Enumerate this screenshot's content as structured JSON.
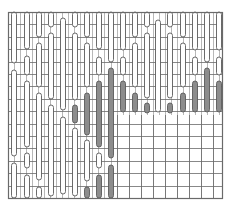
{
  "diagram": {
    "type": "grid-pattern-chart",
    "width": 229,
    "height": 208,
    "frame": {
      "x0": 8,
      "y0": 12,
      "x1": 222,
      "y1": 198
    },
    "colors": {
      "background": "#ffffff",
      "grid_line": "#9a9a9a",
      "frame_line": "#6a6a6a",
      "capsule_stroke": "#5a5a5a",
      "capsule_light": "#ffffff",
      "capsule_dark": "#8c8c8c"
    },
    "rows_y": [
      12,
      24.4,
      36.8,
      49.2,
      61.6,
      74,
      86.4,
      98.8,
      111.2,
      123.6,
      136,
      148.4,
      160.8,
      173.2,
      185.6,
      198
    ],
    "fine_grid": {
      "x_start": 8,
      "x_end": 222,
      "pitch": 6.03,
      "region_note": "fine columns cover full width above y=115 and the left part (x<117) below"
    },
    "coarse_region": {
      "x0": 117,
      "y0": 115,
      "x1": 222,
      "y1": 198,
      "cols_x": [
        117,
        129,
        141,
        153,
        165,
        177,
        189,
        201,
        213,
        222
      ]
    },
    "capsule_width": 5,
    "columns": [
      {
        "x": 14,
        "capsules": [
          {
            "y0": 12,
            "y1": 63,
            "fill": "light"
          },
          {
            "y0": 70,
            "y1": 156,
            "fill": "light"
          },
          {
            "y0": 163,
            "y1": 198,
            "fill": "light"
          }
        ]
      },
      {
        "x": 27,
        "capsules": [
          {
            "y0": 12,
            "y1": 49,
            "fill": "light"
          },
          {
            "y0": 56,
            "y1": 75,
            "fill": "light"
          },
          {
            "y0": 81,
            "y1": 147,
            "fill": "light"
          },
          {
            "y0": 153,
            "y1": 168,
            "fill": "light"
          },
          {
            "y0": 175,
            "y1": 198,
            "fill": "light"
          }
        ]
      },
      {
        "x": 39,
        "capsules": [
          {
            "y0": 12,
            "y1": 37,
            "fill": "light"
          },
          {
            "y0": 43,
            "y1": 87,
            "fill": "light"
          },
          {
            "y0": 93,
            "y1": 180,
            "fill": "light"
          },
          {
            "y0": 187,
            "y1": 198,
            "fill": "light"
          }
        ]
      },
      {
        "x": 51,
        "capsules": [
          {
            "y0": 12,
            "y1": 27,
            "fill": "light"
          },
          {
            "y0": 33,
            "y1": 99,
            "fill": "light"
          },
          {
            "y0": 105,
            "y1": 196,
            "fill": "light"
          }
        ]
      },
      {
        "x": 63,
        "capsules": [
          {
            "y0": 18,
            "y1": 110,
            "fill": "light"
          },
          {
            "y0": 117,
            "y1": 194,
            "fill": "light"
          }
        ]
      },
      {
        "x": 75,
        "capsules": [
          {
            "y0": 12,
            "y1": 27,
            "fill": "light"
          },
          {
            "y0": 33,
            "y1": 100,
            "fill": "light"
          },
          {
            "y0": 105,
            "y1": 123,
            "fill": "dark"
          },
          {
            "y0": 128,
            "y1": 196,
            "fill": "light"
          }
        ]
      },
      {
        "x": 87,
        "capsules": [
          {
            "y0": 12,
            "y1": 37,
            "fill": "light"
          },
          {
            "y0": 43,
            "y1": 87,
            "fill": "light"
          },
          {
            "y0": 93,
            "y1": 135,
            "fill": "dark"
          },
          {
            "y0": 140,
            "y1": 181,
            "fill": "light"
          },
          {
            "y0": 187,
            "y1": 198,
            "fill": "dark"
          }
        ]
      },
      {
        "x": 99,
        "capsules": [
          {
            "y0": 12,
            "y1": 49,
            "fill": "light"
          },
          {
            "y0": 57,
            "y1": 75,
            "fill": "light"
          },
          {
            "y0": 81,
            "y1": 147,
            "fill": "dark"
          },
          {
            "y0": 153,
            "y1": 168,
            "fill": "light"
          },
          {
            "y0": 175,
            "y1": 198,
            "fill": "dark"
          }
        ]
      },
      {
        "x": 111,
        "capsules": [
          {
            "y0": 12,
            "y1": 62,
            "fill": "light"
          },
          {
            "y0": 68,
            "y1": 158,
            "fill": "dark"
          },
          {
            "y0": 165,
            "y1": 198,
            "fill": "dark"
          }
        ]
      },
      {
        "x": 123,
        "capsules": [
          {
            "y0": 12,
            "y1": 50,
            "fill": "light"
          },
          {
            "y0": 57,
            "y1": 75,
            "fill": "light"
          },
          {
            "y0": 81,
            "y1": 112,
            "fill": "dark"
          }
        ]
      },
      {
        "x": 135,
        "capsules": [
          {
            "y0": 12,
            "y1": 37,
            "fill": "light"
          },
          {
            "y0": 43,
            "y1": 87,
            "fill": "light"
          },
          {
            "y0": 93,
            "y1": 112,
            "fill": "dark"
          }
        ]
      },
      {
        "x": 147,
        "capsules": [
          {
            "y0": 12,
            "y1": 27,
            "fill": "light"
          },
          {
            "y0": 33,
            "y1": 98,
            "fill": "light"
          },
          {
            "y0": 103,
            "y1": 113,
            "fill": "dark"
          }
        ]
      },
      {
        "x": 158,
        "capsules": [
          {
            "y0": 20,
            "y1": 112,
            "fill": "light"
          }
        ]
      },
      {
        "x": 170,
        "capsules": [
          {
            "y0": 12,
            "y1": 27,
            "fill": "light"
          },
          {
            "y0": 33,
            "y1": 98,
            "fill": "light"
          },
          {
            "y0": 103,
            "y1": 113,
            "fill": "dark"
          }
        ]
      },
      {
        "x": 183,
        "capsules": [
          {
            "y0": 12,
            "y1": 37,
            "fill": "light"
          },
          {
            "y0": 43,
            "y1": 87,
            "fill": "light"
          },
          {
            "y0": 93,
            "y1": 112,
            "fill": "dark"
          }
        ]
      },
      {
        "x": 195,
        "capsules": [
          {
            "y0": 12,
            "y1": 50,
            "fill": "light"
          },
          {
            "y0": 57,
            "y1": 75,
            "fill": "light"
          },
          {
            "y0": 81,
            "y1": 112,
            "fill": "dark"
          }
        ]
      },
      {
        "x": 207,
        "capsules": [
          {
            "y0": 12,
            "y1": 62,
            "fill": "light"
          },
          {
            "y0": 68,
            "y1": 112,
            "fill": "dark"
          }
        ]
      },
      {
        "x": 219,
        "capsules": [
          {
            "y0": 12,
            "y1": 50,
            "fill": "light"
          },
          {
            "y0": 57,
            "y1": 75,
            "fill": "light"
          },
          {
            "y0": 81,
            "y1": 112,
            "fill": "dark"
          }
        ]
      }
    ]
  }
}
